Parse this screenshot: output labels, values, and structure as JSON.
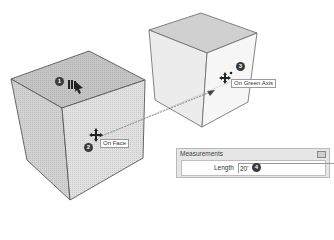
{
  "scene": {
    "description": "SketchUp Move tool illustration with two cubes",
    "steps": [
      {
        "number": "1",
        "label": ""
      },
      {
        "number": "2",
        "label": "On Face"
      },
      {
        "number": "3",
        "label": "On Green Axis"
      },
      {
        "number": "4",
        "label": ""
      }
    ]
  },
  "tooltips": {
    "on_face": "On Face",
    "on_green_axis": "On Green Axis"
  },
  "badges": {
    "b1": "1",
    "b2": "2",
    "b3": "3",
    "b4": "4"
  },
  "measurements": {
    "title": "Measurements",
    "length_label": "Length",
    "length_value": "20'"
  },
  "colors": {
    "cube_top": "#c8c8c8",
    "cube_left": "#d4d4d4",
    "cube_right": "#e4e4e4",
    "edge": "#555555",
    "badge": "#3a3a3a"
  }
}
